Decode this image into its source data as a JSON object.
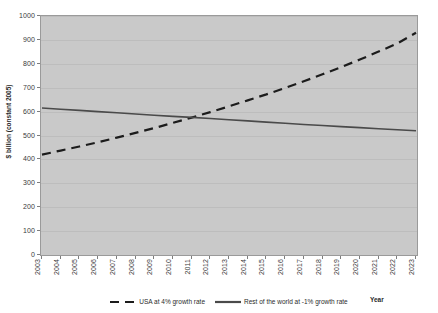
{
  "chart_data": {
    "type": "line",
    "title": "",
    "xlabel": "Year",
    "ylabel": "$ billion (constant 2005)",
    "xlim": [
      2003,
      2023
    ],
    "ylim": [
      0,
      1000
    ],
    "grid": true,
    "legend_position": "bottom",
    "x": [
      2003,
      2004,
      2005,
      2006,
      2007,
      2008,
      2009,
      2010,
      2011,
      2012,
      2013,
      2014,
      2015,
      2016,
      2017,
      2018,
      2019,
      2020,
      2021,
      2022,
      2023
    ],
    "y_ticks": [
      0,
      100,
      200,
      300,
      400,
      500,
      600,
      700,
      800,
      900,
      1000
    ],
    "series": [
      {
        "name": "USA at 4% growth rate",
        "style": "dashed",
        "color": "#1c1c1c",
        "values": [
          420,
          437,
          454,
          472,
          491,
          511,
          531,
          553,
          575,
          598,
          622,
          647,
          672,
          699,
          727,
          756,
          786,
          818,
          851,
          885,
          930
        ]
      },
      {
        "name": "Rest of the world at -1% growth rate",
        "style": "solid",
        "color": "#4a4a4a",
        "values": [
          615,
          610,
          605,
          600,
          595,
          590,
          585,
          580,
          576,
          571,
          566,
          561,
          556,
          551,
          546,
          542,
          537,
          533,
          528,
          524,
          520
        ]
      }
    ]
  },
  "colors": {
    "plot_background": "#c9c9c9",
    "page_background": "#ffffff",
    "gridline": "#bdbdbd",
    "axis": "#9a9a9a",
    "text": "#2b2b2b"
  }
}
